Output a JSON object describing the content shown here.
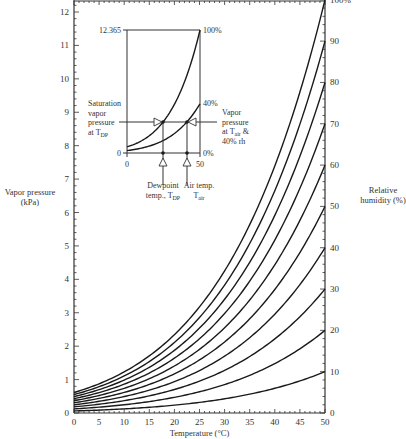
{
  "chart_data": {
    "type": "line",
    "title": "",
    "xlabel": "Temperature (°C)",
    "ylabel": "Vapor pressure (kPa)",
    "ylabel_lines": [
      "Vapor pressure",
      "(kPa)"
    ],
    "y2label": "Relative humidity (%)",
    "y2label_lines": [
      "Relative",
      "humidity (%)"
    ],
    "xlim": [
      0,
      50
    ],
    "ylim": [
      0,
      12.365
    ],
    "x_ticks": [
      0,
      5,
      10,
      15,
      20,
      25,
      30,
      35,
      40,
      45,
      50
    ],
    "y_ticks": [
      0,
      1,
      2,
      3,
      4,
      5,
      6,
      7,
      8,
      9,
      10,
      11,
      12
    ],
    "y2_ticks": [
      0,
      10,
      20,
      30,
      40,
      50,
      60,
      70,
      80,
      90,
      100
    ],
    "y2_tick_labels": [
      "0",
      "10",
      "20",
      "30",
      "40",
      "50",
      "60",
      "70",
      "80",
      "90",
      "100%"
    ],
    "grid": false,
    "legend": "none",
    "x": [
      0,
      5,
      10,
      15,
      20,
      25,
      30,
      35,
      40,
      45,
      50
    ],
    "saturation_vapor_pressure_kPa": [
      0.611,
      0.872,
      1.228,
      1.705,
      2.338,
      3.168,
      4.245,
      5.626,
      7.381,
      9.59,
      12.365
    ],
    "series": [
      {
        "name": "10%",
        "rh": 10,
        "values": [
          0.061,
          0.087,
          0.123,
          0.171,
          0.234,
          0.317,
          0.425,
          0.563,
          0.738,
          0.959,
          1.237
        ]
      },
      {
        "name": "20%",
        "rh": 20,
        "values": [
          0.122,
          0.174,
          0.246,
          0.341,
          0.468,
          0.634,
          0.849,
          1.125,
          1.476,
          1.918,
          2.473
        ]
      },
      {
        "name": "30%",
        "rh": 30,
        "values": [
          0.183,
          0.262,
          0.368,
          0.512,
          0.701,
          0.95,
          1.274,
          1.688,
          2.214,
          2.877,
          3.71
        ]
      },
      {
        "name": "40%",
        "rh": 40,
        "values": [
          0.244,
          0.349,
          0.491,
          0.682,
          0.935,
          1.267,
          1.698,
          2.25,
          2.952,
          3.836,
          4.946
        ]
      },
      {
        "name": "50%",
        "rh": 50,
        "values": [
          0.306,
          0.436,
          0.614,
          0.853,
          1.169,
          1.584,
          2.123,
          2.813,
          3.691,
          4.795,
          6.183
        ]
      },
      {
        "name": "60%",
        "rh": 60,
        "values": [
          0.367,
          0.523,
          0.737,
          1.023,
          1.403,
          1.901,
          2.547,
          3.376,
          4.429,
          5.754,
          7.419
        ]
      },
      {
        "name": "70%",
        "rh": 70,
        "values": [
          0.428,
          0.61,
          0.86,
          1.194,
          1.637,
          2.218,
          2.972,
          3.938,
          5.167,
          6.713,
          8.656
        ]
      },
      {
        "name": "80%",
        "rh": 80,
        "values": [
          0.489,
          0.698,
          0.982,
          1.364,
          1.87,
          2.534,
          3.396,
          4.501,
          5.905,
          7.672,
          9.892
        ]
      },
      {
        "name": "90%",
        "rh": 90,
        "values": [
          0.55,
          0.785,
          1.105,
          1.535,
          2.104,
          2.851,
          3.821,
          5.063,
          6.643,
          8.631,
          11.129
        ]
      },
      {
        "name": "100%",
        "rh": 100,
        "values": [
          0.611,
          0.872,
          1.228,
          1.705,
          2.338,
          3.168,
          4.245,
          5.626,
          7.381,
          9.59,
          12.365
        ]
      }
    ],
    "inset": {
      "y_top_label": "12.365",
      "y_bottom_label": "0",
      "x_left_label": "0",
      "x_right_label": "50",
      "curve_labels": [
        "100%",
        "40%",
        "0%"
      ],
      "annotation_left": [
        "Saturation",
        "vapor",
        "pressure",
        "at T_DP"
      ],
      "annotation_right": [
        "Vapor",
        "pressure",
        "at T_air &",
        "40% rh"
      ],
      "arrow_label_dewpoint": [
        "Dewpoint",
        "temp., T_DP"
      ],
      "arrow_label_air": [
        "Air temp.",
        "T_air"
      ],
      "dewpoint_temp_c": 17.5,
      "air_temp_c": 34,
      "vapor_pressure_kPa": 2.0
    }
  },
  "colors": {
    "line": "#1a1a1a",
    "axis": "#333333",
    "text": "#333333",
    "background": "#ffffff"
  }
}
